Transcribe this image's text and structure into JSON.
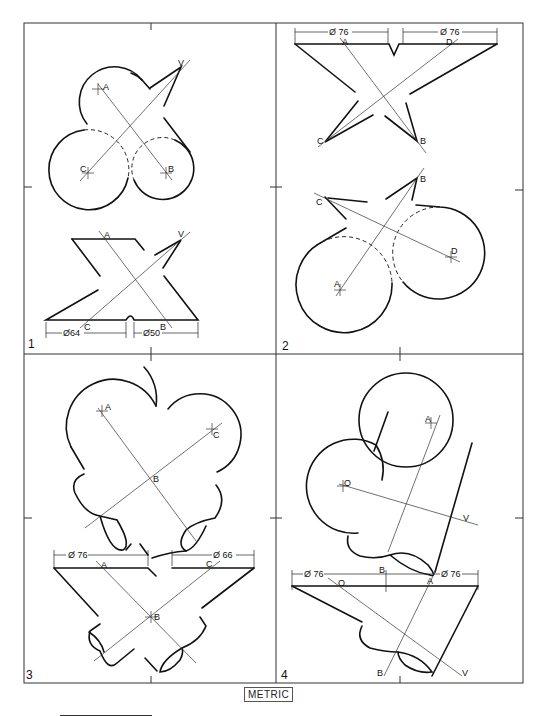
{
  "panels": [
    {
      "number": "1",
      "top_view_labels": [
        "A",
        "B",
        "C",
        "V"
      ],
      "bottom_view_labels": [
        "A",
        "B",
        "C",
        "V"
      ],
      "dimensions": [
        "Ø64",
        "Ø50"
      ]
    },
    {
      "number": "2",
      "top_view_labels": [
        "A",
        "B",
        "C",
        "D"
      ],
      "bottom_view_labels": [
        "A",
        "B",
        "C",
        "D"
      ],
      "dimensions": [
        "Ø 76",
        "Ø 76"
      ]
    },
    {
      "number": "3",
      "top_view_labels": [
        "A",
        "B",
        "C"
      ],
      "bottom_view_labels": [
        "A",
        "B",
        "C"
      ],
      "dimensions": [
        "Ø 76",
        "Ø 66"
      ]
    },
    {
      "number": "4",
      "top_view_labels": [
        "A",
        "O",
        "V"
      ],
      "bottom_view_labels": [
        "O",
        "A",
        "B",
        "B",
        "V"
      ],
      "dimensions": [
        "Ø 76",
        "Ø 76"
      ]
    }
  ],
  "footer": {
    "units_label": "METRIC"
  }
}
